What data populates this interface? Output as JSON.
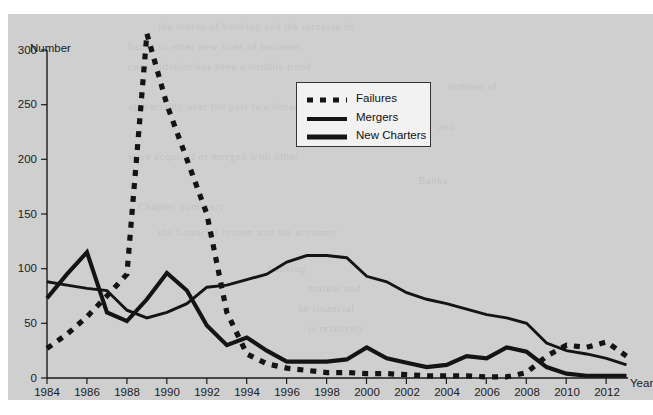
{
  "axes": {
    "y_axis_label": "Number",
    "x_axis_label": "Year",
    "y_ticks": [
      "0",
      "50",
      "100",
      "150",
      "200",
      "250",
      "300"
    ],
    "x_ticks": [
      "1984",
      "1986",
      "1988",
      "1990",
      "1992",
      "1994",
      "1996",
      "1998",
      "2000",
      "2002",
      "2004",
      "2006",
      "2008",
      "2010",
      "2012"
    ]
  },
  "legend": {
    "position": "top-center",
    "entries": [
      {
        "label": "Failures",
        "style": "dotted",
        "swatch": "dotted-line-swatch"
      },
      {
        "label": "Mergers",
        "style": "solid-thin",
        "swatch": "solid-thin-line-swatch"
      },
      {
        "label": "New Charters",
        "style": "solid-thick",
        "swatch": "solid-thick-line-swatch"
      }
    ]
  },
  "colors": {
    "plot_background": "#cfcfcf",
    "page_background": "#ffffff",
    "line": "#141414",
    "legend_background": "#f2f2f2",
    "legend_border": "#333333",
    "axis": "#1a1a1a"
  },
  "chart_data": {
    "type": "line",
    "title": "",
    "subtitle": "",
    "xlabel": "Year",
    "ylabel": "Number",
    "xlim": [
      1984,
      2013
    ],
    "ylim": [
      0,
      300
    ],
    "y_tick_step": 50,
    "x_tick_step": 2,
    "grid": false,
    "legend_position": "top-center",
    "x": [
      1984,
      1985,
      1986,
      1987,
      1988,
      1989,
      1990,
      1991,
      1992,
      1993,
      1994,
      1995,
      1996,
      1997,
      1998,
      1999,
      2000,
      2001,
      2002,
      2003,
      2004,
      2005,
      2006,
      2007,
      2008,
      2009,
      2010,
      2011,
      2012,
      2013
    ],
    "series": [
      {
        "name": "Failures",
        "style": "dotted",
        "values": [
          27,
          40,
          56,
          75,
          95,
          315,
          250,
          200,
          150,
          60,
          22,
          13,
          9,
          7,
          5,
          5,
          4,
          4,
          3,
          2,
          2,
          2,
          1,
          1,
          5,
          20,
          30,
          28,
          33,
          20
        ]
      },
      {
        "name": "Mergers",
        "style": "solid-thin",
        "values": [
          88,
          85,
          82,
          80,
          62,
          55,
          60,
          68,
          83,
          85,
          90,
          95,
          106,
          112,
          112,
          110,
          93,
          88,
          78,
          72,
          68,
          63,
          58,
          55,
          50,
          32,
          25,
          22,
          18,
          12
        ]
      },
      {
        "name": "New Charters",
        "style": "solid-thick",
        "values": [
          73,
          95,
          115,
          60,
          52,
          72,
          96,
          80,
          48,
          30,
          37,
          25,
          15,
          15,
          15,
          17,
          28,
          18,
          14,
          10,
          12,
          20,
          18,
          28,
          24,
          10,
          4,
          2,
          2,
          2
        ]
      }
    ]
  }
}
